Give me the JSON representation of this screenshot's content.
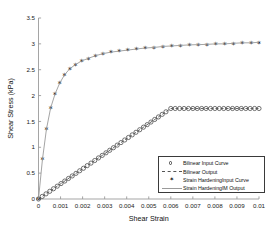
{
  "chart_data": {
    "type": "line",
    "title": "",
    "xlabel": "Shear Strain",
    "ylabel": "Shear Stress (kPa)",
    "xlim": [
      0,
      0.01
    ],
    "ylim": [
      0,
      3.5
    ],
    "grid": false,
    "legend_position": "lower right",
    "xticks": [
      "0",
      "0.001",
      "0.002",
      "0.003",
      "0.004",
      "0.005",
      "0.006",
      "0.007",
      "0.008",
      "0.009",
      "0.01"
    ],
    "xtick_values": [
      0,
      0.001,
      0.002,
      0.003,
      0.004,
      0.005,
      0.006,
      0.007,
      0.008,
      0.009,
      0.01
    ],
    "yticks": [
      "0",
      "0.5",
      "1",
      "1.5",
      "2",
      "2.5",
      "3",
      "3.5"
    ],
    "ytick_values": [
      0,
      0.5,
      1,
      1.5,
      2,
      2.5,
      3,
      3.5
    ],
    "series": [
      {
        "name": "Bilinear Input Curve",
        "marker": "open-circle",
        "linestyle": "none",
        "color": "#444444",
        "x": [
          0,
          0.00017,
          0.00034,
          0.00051,
          0.00068,
          0.00085,
          0.00102,
          0.00119,
          0.00136,
          0.00153,
          0.0017,
          0.00187,
          0.00204,
          0.00221,
          0.00238,
          0.00255,
          0.00272,
          0.00289,
          0.00306,
          0.00323,
          0.0034,
          0.00357,
          0.00374,
          0.00391,
          0.00408,
          0.00425,
          0.00442,
          0.00459,
          0.00476,
          0.00493,
          0.0051,
          0.00527,
          0.00544,
          0.00561,
          0.00578,
          0.006,
          0.0062,
          0.0064,
          0.0066,
          0.0068,
          0.007,
          0.0072,
          0.0074,
          0.0076,
          0.0078,
          0.008,
          0.0082,
          0.0084,
          0.0086,
          0.0088,
          0.009,
          0.0092,
          0.0094,
          0.0096,
          0.0098,
          0.01
        ],
        "y": [
          0,
          0.05,
          0.099,
          0.149,
          0.198,
          0.248,
          0.298,
          0.347,
          0.397,
          0.446,
          0.496,
          0.546,
          0.595,
          0.645,
          0.694,
          0.744,
          0.794,
          0.843,
          0.893,
          0.942,
          0.992,
          1.042,
          1.091,
          1.141,
          1.19,
          1.24,
          1.29,
          1.339,
          1.389,
          1.438,
          1.488,
          1.538,
          1.587,
          1.637,
          1.686,
          1.75,
          1.75,
          1.75,
          1.75,
          1.75,
          1.75,
          1.75,
          1.75,
          1.75,
          1.75,
          1.75,
          1.75,
          1.75,
          1.75,
          1.75,
          1.75,
          1.75,
          1.75,
          1.75,
          1.75,
          1.75
        ]
      },
      {
        "name": "Bilinear Output",
        "marker": "none",
        "linestyle": "dashed",
        "color": "#555555",
        "x": [
          0,
          0.006,
          0.01
        ],
        "y": [
          0,
          1.75,
          1.75
        ]
      },
      {
        "name": "Strain HardeningInput Curve",
        "marker": "filled-star",
        "linestyle": "none",
        "color": "#222222",
        "x": [
          0,
          0.00018,
          0.00036,
          0.00055,
          0.00075,
          0.00096,
          0.00118,
          0.00142,
          0.00168,
          0.00196,
          0.00226,
          0.00258,
          0.00292,
          0.00328,
          0.00366,
          0.00405,
          0.00444,
          0.00484,
          0.00524,
          0.00564,
          0.00604,
          0.00644,
          0.00684,
          0.00724,
          0.00764,
          0.00804,
          0.00844,
          0.00884,
          0.00924,
          0.00964,
          0.01
        ],
        "y": [
          0,
          0.77,
          1.35,
          1.76,
          2.03,
          2.24,
          2.4,
          2.52,
          2.6,
          2.67,
          2.72,
          2.77,
          2.81,
          2.84,
          2.86,
          2.88,
          2.9,
          2.92,
          2.93,
          2.95,
          2.96,
          2.97,
          2.98,
          2.985,
          2.99,
          3.0,
          3.0,
          3.01,
          3.02,
          3.02,
          3.03
        ]
      },
      {
        "name": "Strain HardeningIM Output",
        "marker": "none",
        "linestyle": "solid",
        "color": "#9a9a9a",
        "x": [
          0,
          0.00018,
          0.00036,
          0.00055,
          0.00075,
          0.00096,
          0.00118,
          0.00142,
          0.00168,
          0.00196,
          0.00226,
          0.00258,
          0.00292,
          0.00328,
          0.00366,
          0.00405,
          0.00444,
          0.00484,
          0.00524,
          0.00564,
          0.00604,
          0.00644,
          0.00684,
          0.00724,
          0.00764,
          0.00804,
          0.00844,
          0.00884,
          0.00924,
          0.00964,
          0.01
        ],
        "y": [
          0,
          0.77,
          1.35,
          1.76,
          2.03,
          2.24,
          2.4,
          2.52,
          2.6,
          2.67,
          2.72,
          2.77,
          2.81,
          2.84,
          2.86,
          2.88,
          2.9,
          2.92,
          2.93,
          2.95,
          2.96,
          2.97,
          2.98,
          2.985,
          2.99,
          3.0,
          3.0,
          3.01,
          3.02,
          3.02,
          3.03
        ]
      }
    ]
  },
  "legend": {
    "entries": [
      {
        "label": "Bilinear Input Curve",
        "key": "open-circle"
      },
      {
        "label": "Bilinear Output",
        "key": "dashed-line"
      },
      {
        "label": "Strain HardeningInput Curve",
        "key": "filled-star"
      },
      {
        "label": "Strain HardeningIM Output",
        "key": "solid-line"
      }
    ]
  },
  "star_glyph": "✶"
}
